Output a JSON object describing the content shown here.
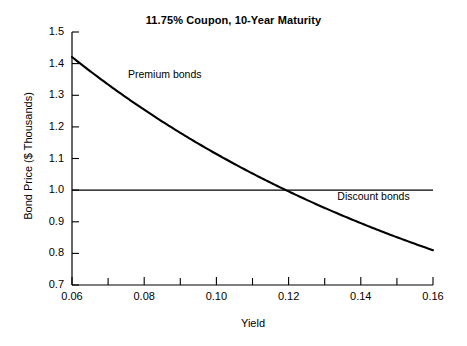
{
  "chart_data": {
    "type": "line",
    "title": "11.75% Coupon, 10-Year Maturity",
    "xlabel": "Yield",
    "ylabel": "Bond Price ($ Thousands)",
    "xlim": [
      0.06,
      0.16
    ],
    "ylim": [
      0.7,
      1.5
    ],
    "grid": false,
    "legend": "none",
    "xticks": [
      0.06,
      0.08,
      0.1,
      0.12,
      0.14,
      0.16
    ],
    "xtick_labels": [
      "0.06",
      "0.08",
      "0.10",
      "0.12",
      "0.14",
      "0.16"
    ],
    "xticks_minor": [
      0.07,
      0.09,
      0.11,
      0.13,
      0.15
    ],
    "yticks": [
      0.7,
      0.8,
      0.9,
      1.0,
      1.1,
      1.2,
      1.3,
      1.4,
      1.5
    ],
    "ytick_labels": [
      "0.7",
      "0.8",
      "0.9",
      "1.0",
      "1.1",
      "1.2",
      "1.3",
      "1.4",
      "1.5"
    ],
    "series": [
      {
        "name": "Bond price vs yield",
        "color": "#000000",
        "x": [
          0.06,
          0.065,
          0.07,
          0.075,
          0.08,
          0.085,
          0.09,
          0.095,
          0.1,
          0.105,
          0.11,
          0.1175,
          0.12,
          0.125,
          0.13,
          0.135,
          0.14,
          0.145,
          0.15,
          0.155,
          0.16
        ],
        "y": [
          1.421,
          1.383,
          1.347,
          1.311,
          1.277,
          1.244,
          1.212,
          1.181,
          1.151,
          1.122,
          1.094,
          1.0,
          1.043,
          1.018,
          0.993,
          0.969,
          0.946,
          0.923,
          0.901,
          0.88,
          0.81
        ]
      },
      {
        "name": "Par value reference line",
        "color": "#000000",
        "x": [
          0.06,
          0.16
        ],
        "y": [
          1.0,
          1.0
        ]
      }
    ],
    "annotations": [
      {
        "text": "Premium bonds",
        "x": 0.0755,
        "y": 1.365
      },
      {
        "text": "Discount bonds",
        "x": 0.1335,
        "y": 0.978
      }
    ]
  }
}
